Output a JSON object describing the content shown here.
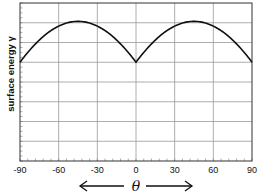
{
  "chart_data": {
    "type": "line",
    "title": "",
    "xlabel": "θ",
    "ylabel": "surface energy γ",
    "xlim": [
      -90,
      90
    ],
    "ylim": [
      0,
      1.6
    ],
    "xticks": [
      -90,
      -60,
      -30,
      0,
      30,
      60,
      90
    ],
    "xtick_labels": [
      "-90",
      "-60",
      "-30",
      "0",
      "30",
      "60",
      "90"
    ],
    "yticks_gridlines": [
      0.2,
      0.4,
      0.6,
      0.8,
      1.0,
      1.2,
      1.4
    ],
    "ytick_labels": [],
    "grid": true,
    "x_axis_arrows": "both",
    "series": [
      {
        "name": "surface energy γ(θ) = |sin θ| + |cos θ|",
        "x": [
          -90,
          -80,
          -70,
          -60,
          -50,
          -45,
          -40,
          -30,
          -20,
          -10,
          0,
          10,
          20,
          30,
          40,
          45,
          50,
          60,
          70,
          80,
          90
        ],
        "values": [
          1.0,
          1.158,
          1.282,
          1.366,
          1.408,
          1.414,
          1.408,
          1.366,
          1.282,
          1.158,
          1.0,
          1.158,
          1.282,
          1.366,
          1.408,
          1.414,
          1.408,
          1.366,
          1.282,
          1.158,
          1.0
        ],
        "color": "#111111"
      }
    ]
  }
}
